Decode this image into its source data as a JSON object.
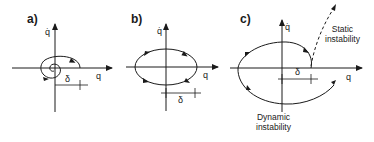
{
  "panels": [
    {
      "id": "a",
      "label": "a)",
      "x_axis_label": "q",
      "y_axis_label": "q̇",
      "offset_label": "δ",
      "trajectory": "converging spiral (stable focus)"
    },
    {
      "id": "b",
      "label": "b)",
      "x_axis_label": "q",
      "y_axis_label": "q̇",
      "offset_label": "δ",
      "trajectory": "closed ellipse (neutral oscillation)"
    },
    {
      "id": "c",
      "label": "c)",
      "x_axis_label": "q",
      "y_axis_label": "q̇",
      "offset_label": "δ",
      "trajectory": "diverging spiral",
      "annotations": {
        "static": [
          "Static",
          "instability"
        ],
        "dynamic": [
          "Dynamic",
          "instability"
        ]
      }
    }
  ],
  "colors": {
    "line": "#1a1a1a",
    "background": "#ffffff"
  }
}
